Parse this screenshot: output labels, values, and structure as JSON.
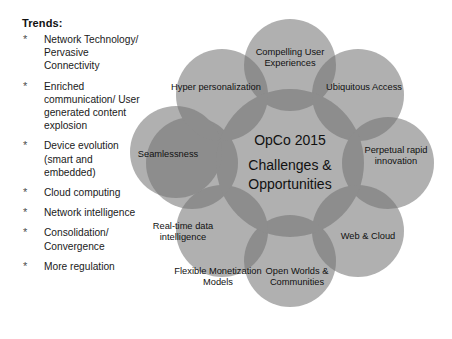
{
  "trends": {
    "heading": "Trends:",
    "bullet_glyph": "*",
    "items": [
      "Network Technology/ Pervasive Connectivity",
      "Enriched communication/ User generated content explosion",
      "Device evolution (smart and embedded)",
      "Cloud computing",
      "Network intelligence",
      "Consolidation/ Convergence",
      "More regulation"
    ]
  },
  "diagram": {
    "colors": {
      "petal_fill": "#b0b0b0",
      "overlap_fill": "#8d8d8d",
      "text": "#111111",
      "background": "#ffffff"
    },
    "center": {
      "line_1": "OpCo 2015",
      "line_2": "Challenges & Opportunities"
    },
    "petals": [
      {
        "label": "Compelling User Experiences",
        "cx": 170,
        "cy": 65,
        "r": 46,
        "lx": 170,
        "ly": 58
      },
      {
        "label": "Ubiquitous Access",
        "cx": 238,
        "cy": 95,
        "r": 46,
        "lx": 244,
        "ly": 88
      },
      {
        "label": "Perpetual rapid innovation",
        "cx": 268,
        "cy": 163,
        "r": 46,
        "lx": 276,
        "ly": 156
      },
      {
        "label": "Web & Cloud",
        "cx": 238,
        "cy": 231,
        "r": 46,
        "lx": 248,
        "ly": 237
      },
      {
        "label": "Open Worlds & Communities",
        "cx": 170,
        "cy": 261,
        "r": 46,
        "lx": 177,
        "ly": 277
      },
      {
        "label": "Flexible Monetization Models",
        "cx": 102,
        "cy": 231,
        "r": 46,
        "lx": 98,
        "ly": 277
      },
      {
        "label": "Real-time data intelligence",
        "cx": 72,
        "cy": 163,
        "r": 46,
        "lx": 63,
        "ly": 232
      },
      {
        "label": "Hyper personalization",
        "cx": 102,
        "cy": 95,
        "r": 46,
        "lx": 96,
        "ly": 88
      },
      {
        "label": "Seamlessness",
        "cx": 56,
        "cy": 152,
        "r": 46,
        "lx": 48,
        "ly": 155
      }
    ],
    "center_circle": {
      "cx": 170,
      "cy": 163,
      "r": 74
    }
  }
}
